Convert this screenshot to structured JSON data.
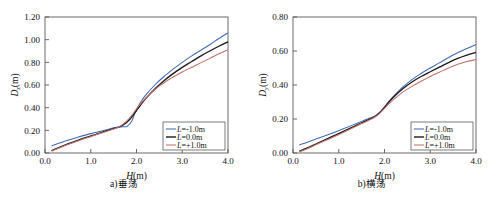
{
  "figure": {
    "panels": [
      {
        "caption": "a)垂荡",
        "chart_data": {
          "type": "line",
          "title": "",
          "xlabel_italic": "H",
          "xlabel_unit": "(m)",
          "ylabel_italic": "D",
          "ylabel_sub": "z",
          "ylabel_unit": "(m)",
          "xlim": [
            0.0,
            4.0
          ],
          "ylim": [
            0.0,
            1.2
          ],
          "xticks": [
            "0.0",
            "1.0",
            "2.0",
            "3.0",
            "4.0"
          ],
          "xtick_values": [
            0.0,
            1.0,
            2.0,
            3.0,
            4.0
          ],
          "yticks": [
            "0.00",
            "0.20",
            "0.40",
            "0.60",
            "0.80",
            "1.00",
            "1.20"
          ],
          "ytick_values": [
            0.0,
            0.2,
            0.4,
            0.6,
            0.8,
            1.0,
            1.2
          ],
          "grid": false,
          "legend_position": "lower right",
          "x": [
            0.15,
            0.3,
            0.5,
            0.7,
            0.9,
            1.1,
            1.3,
            1.5,
            1.6,
            1.7,
            1.8,
            1.9,
            2.0,
            2.1,
            2.2,
            2.4,
            2.6,
            2.8,
            3.0,
            3.2,
            3.4,
            3.6,
            3.8,
            4.0
          ],
          "series": [
            {
              "name": "L=-1.0m",
              "color": "#4169b5",
              "values": [
                0.065,
                0.085,
                0.112,
                0.137,
                0.16,
                0.18,
                0.2,
                0.222,
                0.228,
                0.231,
                0.236,
                0.285,
                0.385,
                0.455,
                0.51,
                0.6,
                0.675,
                0.74,
                0.8,
                0.855,
                0.905,
                0.955,
                1.01,
                1.06
              ]
            },
            {
              "name": "L=0.0m",
              "color": "#1a1a1a",
              "values": [
                0.022,
                0.048,
                0.08,
                0.11,
                0.138,
                0.163,
                0.19,
                0.215,
                0.228,
                0.245,
                0.275,
                0.32,
                0.375,
                0.43,
                0.48,
                0.565,
                0.638,
                0.7,
                0.755,
                0.805,
                0.855,
                0.9,
                0.942,
                0.98
              ]
            },
            {
              "name": "L=+1.0m",
              "color": "#c4706a",
              "values": [
                0.018,
                0.042,
                0.074,
                0.104,
                0.132,
                0.158,
                0.185,
                0.212,
                0.228,
                0.252,
                0.288,
                0.335,
                0.39,
                0.44,
                0.485,
                0.56,
                0.62,
                0.67,
                0.715,
                0.755,
                0.795,
                0.835,
                0.875,
                0.912
              ]
            }
          ]
        }
      },
      {
        "caption": "b)横荡",
        "chart_data": {
          "type": "line",
          "title": "",
          "xlabel_italic": "H",
          "xlabel_unit": "(m)",
          "ylabel_italic": "D",
          "ylabel_sub": "y",
          "ylabel_unit": "(m)",
          "xlim": [
            0.0,
            4.0
          ],
          "ylim": [
            0.0,
            0.8
          ],
          "xticks": [
            "0.0",
            "1.0",
            "2.0",
            "3.0",
            "4.0"
          ],
          "xtick_values": [
            0.0,
            1.0,
            2.0,
            3.0,
            4.0
          ],
          "yticks": [
            "0.00",
            "0.20",
            "0.40",
            "0.60",
            "0.80"
          ],
          "ytick_values": [
            0.0,
            0.2,
            0.4,
            0.6,
            0.8
          ],
          "grid": false,
          "legend_position": "lower right",
          "x": [
            0.15,
            0.3,
            0.5,
            0.7,
            0.9,
            1.1,
            1.3,
            1.5,
            1.7,
            1.8,
            1.9,
            2.0,
            2.1,
            2.2,
            2.4,
            2.6,
            2.8,
            3.0,
            3.2,
            3.4,
            3.6,
            3.8,
            4.0
          ],
          "series": [
            {
              "name": "L=-1.0m",
              "color": "#4169b5",
              "values": [
                0.048,
                0.062,
                0.082,
                0.101,
                0.121,
                0.142,
                0.164,
                0.186,
                0.208,
                0.22,
                0.24,
                0.272,
                0.305,
                0.335,
                0.388,
                0.432,
                0.468,
                0.5,
                0.53,
                0.562,
                0.59,
                0.615,
                0.638
              ]
            },
            {
              "name": "L=0.0m",
              "color": "#1a1a1a",
              "values": [
                0.012,
                0.028,
                0.053,
                0.078,
                0.102,
                0.127,
                0.152,
                0.178,
                0.202,
                0.216,
                0.238,
                0.268,
                0.3,
                0.33,
                0.378,
                0.418,
                0.45,
                0.478,
                0.505,
                0.532,
                0.556,
                0.576,
                0.592
              ]
            },
            {
              "name": "L=+1.0m",
              "color": "#c4706a",
              "values": [
                0.008,
                0.024,
                0.048,
                0.072,
                0.096,
                0.121,
                0.147,
                0.173,
                0.198,
                0.213,
                0.235,
                0.262,
                0.29,
                0.315,
                0.358,
                0.392,
                0.422,
                0.45,
                0.475,
                0.5,
                0.522,
                0.538,
                0.55
              ]
            }
          ]
        }
      }
    ]
  }
}
